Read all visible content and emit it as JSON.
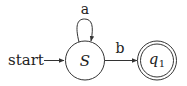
{
  "diagram": {
    "type": "finite-automaton",
    "start_label": "start",
    "states": [
      {
        "id": "S",
        "label": "S",
        "accepting": false,
        "initial": true
      },
      {
        "id": "q1",
        "label": "q",
        "subscript": "1",
        "accepting": true,
        "initial": false
      }
    ],
    "transitions": [
      {
        "from": "S",
        "to": "S",
        "label": "a"
      },
      {
        "from": "S",
        "to": "q1",
        "label": "b"
      }
    ],
    "colors": {
      "stroke": "#333333",
      "text": "#222222",
      "background": "#ffffff"
    }
  }
}
